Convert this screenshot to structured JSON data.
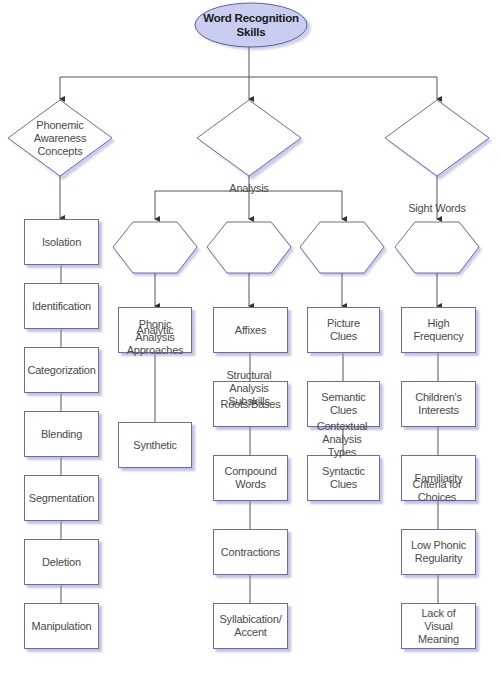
{
  "diagram": {
    "title": "Word Recognition Skills",
    "colors": {
      "oval_fill": "#c9cdf0",
      "oval_stroke": "#5d6190",
      "shape_stroke": "#6c6f9a",
      "shadow": "#9ea3dd",
      "line": "#555555",
      "text": "#4a4a4a"
    },
    "root": {
      "label_line1": "Word Recognition",
      "label_line2": "Skills"
    },
    "categories": [
      {
        "id": "phonemic",
        "shape": "diamond",
        "lines": [
          "Phonemic",
          "Awareness",
          "Concepts"
        ]
      },
      {
        "id": "analysis",
        "shape": "diamond",
        "lines": [
          "Analysis"
        ]
      },
      {
        "id": "sight",
        "shape": "diamond",
        "lines": [
          "Sight Words"
        ]
      }
    ],
    "phonemic_items": [
      "Isolation",
      "Identification",
      "Categorization",
      "Blending",
      "Segmentation",
      "Deletion",
      "Manipulation"
    ],
    "analysis_subgroups": [
      {
        "id": "phonic",
        "lines": [
          "Phonic",
          "Analysis",
          "Approaches"
        ],
        "items": [
          "Analytic",
          "Synthetic"
        ]
      },
      {
        "id": "structural",
        "lines": [
          "Structural",
          "Analysis",
          "Subskills"
        ],
        "items": [
          "Affixes",
          "Roots/Bases",
          "Compound Words",
          "Contractions",
          "Syllabication/ Accent"
        ]
      },
      {
        "id": "contextual",
        "lines": [
          "Contextual",
          "Analysis",
          "Types"
        ],
        "items": [
          "Picture Clues",
          "Semantic Clues",
          "Syntactic Clues"
        ]
      }
    ],
    "sight_subgroup": {
      "lines": [
        "Criteria for",
        "Choices"
      ],
      "items": [
        "High Frequency",
        "Children's Interests",
        "Familiarity",
        "Low Phonic Regularity",
        "Lack of Visual Meaning"
      ]
    }
  }
}
